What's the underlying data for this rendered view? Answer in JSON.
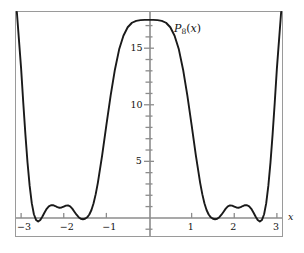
{
  "figure": {
    "background_color": "#ffffff",
    "frame_color": "#9a9a9a",
    "axis_color": "#8c8c8c",
    "curve_color": "#1a1a1a",
    "text_color": "#111111"
  },
  "labels": {
    "curve_label_base": "P",
    "curve_label_sub": "8",
    "curve_label_arg": "(x)",
    "curve_label_full": "P8(x)",
    "xaxis_name": "x"
  },
  "chart_data": {
    "type": "line",
    "title": "",
    "subtitle": "",
    "xlabel": "x",
    "ylabel": "",
    "series_name": "P8(x)",
    "grid": false,
    "legend_position": "inline-annotation",
    "xlim": [
      -3.12,
      3.12
    ],
    "ylim": [
      -1.6,
      18.2
    ],
    "x_major_ticks": [
      -3,
      -2,
      -1,
      1,
      2,
      3
    ],
    "x_tick_labels": [
      "−3",
      "−2",
      "−1",
      "1",
      "2",
      "3"
    ],
    "y_major_ticks": [
      5,
      10,
      15
    ],
    "y_tick_labels": [
      "5",
      "10",
      "15"
    ],
    "y_minor_tick_step": 1,
    "y_minor_ticks": [
      -1,
      1,
      2,
      3,
      4,
      6,
      7,
      8,
      9,
      11,
      12,
      13,
      14,
      16,
      17
    ],
    "annotations": [
      {
        "text": "P8(x)",
        "x": 0.62,
        "y": 16.2
      }
    ],
    "x": [
      -3.1,
      -3.0,
      -2.95,
      -2.9,
      -2.85,
      -2.8,
      -2.75,
      -2.7,
      -2.65,
      -2.6,
      -2.55,
      -2.5,
      -2.45,
      -2.4,
      -2.35,
      -2.3,
      -2.25,
      -2.2,
      -2.15,
      -2.1,
      -2.05,
      -2.0,
      -1.95,
      -1.9,
      -1.85,
      -1.8,
      -1.75,
      -1.7,
      -1.65,
      -1.6,
      -1.55,
      -1.5,
      -1.45,
      -1.4,
      -1.35,
      -1.3,
      -1.25,
      -1.2,
      -1.1,
      -1.0,
      -0.9,
      -0.8,
      -0.7,
      -0.6,
      -0.5,
      -0.4,
      -0.3,
      -0.2,
      -0.1,
      0.0,
      0.1,
      0.2,
      0.3,
      0.4,
      0.5,
      0.6,
      0.7,
      0.8,
      0.9,
      1.0,
      1.1,
      1.2,
      1.25,
      1.3,
      1.35,
      1.4,
      1.45,
      1.5,
      1.55,
      1.6,
      1.65,
      1.7,
      1.75,
      1.8,
      1.85,
      1.9,
      1.95,
      2.0,
      2.05,
      2.1,
      2.15,
      2.2,
      2.25,
      2.3,
      2.35,
      2.4,
      2.45,
      2.5,
      2.55,
      2.6,
      2.65,
      2.7,
      2.75,
      2.8,
      2.85,
      2.9,
      2.95,
      3.0,
      3.1
    ],
    "y": [
      18.2,
      13.2,
      10.2,
      7.4,
      4.9,
      2.85,
      1.3,
      0.32,
      -0.18,
      -0.32,
      -0.18,
      0.12,
      0.48,
      0.8,
      1.02,
      1.12,
      1.12,
      1.05,
      0.95,
      0.9,
      0.92,
      1.0,
      1.08,
      1.1,
      1.02,
      0.82,
      0.55,
      0.28,
      0.06,
      -0.08,
      -0.12,
      -0.08,
      0.05,
      0.3,
      0.7,
      1.3,
      2.1,
      3.1,
      5.5,
      8.2,
      10.8,
      13.1,
      14.9,
      16.1,
      16.85,
      17.25,
      17.42,
      17.48,
      17.5,
      17.5,
      17.5,
      17.48,
      17.42,
      17.25,
      16.85,
      16.1,
      14.9,
      13.1,
      10.8,
      8.2,
      5.5,
      3.1,
      2.1,
      1.3,
      0.7,
      0.3,
      0.05,
      -0.08,
      -0.12,
      -0.08,
      0.06,
      0.28,
      0.55,
      0.82,
      1.02,
      1.1,
      1.08,
      1.0,
      0.92,
      0.9,
      0.95,
      1.05,
      1.12,
      1.12,
      1.02,
      0.8,
      0.48,
      0.12,
      -0.18,
      -0.32,
      -0.18,
      0.32,
      1.3,
      2.85,
      4.9,
      7.4,
      10.2,
      13.2,
      18.2
    ]
  }
}
